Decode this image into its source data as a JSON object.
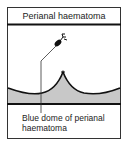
{
  "diagram": {
    "title": "Perianal haematoma",
    "label_line1": "Blue dome of perianal",
    "label_line2": "haematoma",
    "colors": {
      "fill": "#c8c8c8",
      "line": "#111111",
      "background": "#ffffff"
    }
  }
}
